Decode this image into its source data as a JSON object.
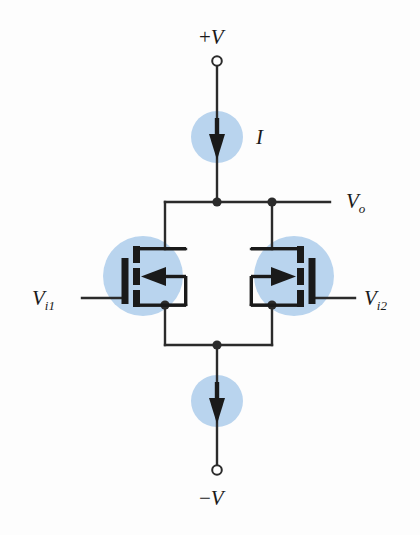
{
  "figure": {
    "name": "mosfet-differential-amplifier",
    "background": "#fdfdfd",
    "wire_color": "#2b2b2b",
    "highlight_color": "#b9d4ee",
    "device_color": "#1a1a1a"
  },
  "labels": {
    "supply_positive_sign": "+",
    "supply_positive": "V",
    "supply_negative_sign": "−",
    "supply_negative": "V",
    "current_source": "I",
    "output": "V",
    "output_sub": "o",
    "input_left": "V",
    "input_left_sub": "i1",
    "input_right": "V",
    "input_right_sub": "i2"
  },
  "components": {
    "current_source_top": {
      "label": "I",
      "direction": "down",
      "highlighted": true
    },
    "current_source_bottom": {
      "label": "",
      "direction": "down",
      "highlighted": true
    },
    "transistor_left": {
      "type": "mosfet",
      "orientation": "gate-left",
      "arrow_direction": "left",
      "highlighted": true
    },
    "transistor_right": {
      "type": "mosfet",
      "orientation": "gate-right",
      "arrow_direction": "right",
      "highlighted": true
    },
    "terminal_top": {
      "style": "open-circle"
    },
    "terminal_bottom": {
      "style": "open-circle"
    }
  },
  "nodes": {
    "top_rail_center": "junction",
    "output_node": "junction",
    "source_left": "junction",
    "source_right": "junction",
    "bottom_rail_center": "junction"
  }
}
